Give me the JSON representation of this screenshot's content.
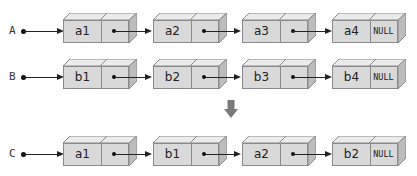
{
  "diagram": {
    "colors": {
      "node_fill": "#d9d9d9",
      "node_top": "#ebebeb",
      "node_side": "#bdbdbd",
      "border": "#8a8a8a",
      "arrow": "#222222",
      "merge_arrow": "#7a7a7a"
    },
    "lists": [
      {
        "pointer": "A",
        "nodes": [
          {
            "data": "a1",
            "next": ""
          },
          {
            "data": "a2",
            "next": ""
          },
          {
            "data": "a3",
            "next": ""
          },
          {
            "data": "a4",
            "next": "NULL"
          }
        ]
      },
      {
        "pointer": "B",
        "nodes": [
          {
            "data": "b1",
            "next": ""
          },
          {
            "data": "b2",
            "next": ""
          },
          {
            "data": "b3",
            "next": ""
          },
          {
            "data": "b4",
            "next": "NULL"
          }
        ]
      },
      {
        "pointer": "C",
        "nodes": [
          {
            "data": "a1",
            "next": ""
          },
          {
            "data": "b1",
            "next": ""
          },
          {
            "data": "a2",
            "next": ""
          },
          {
            "data": "b2",
            "next": "NULL"
          }
        ]
      }
    ],
    "merge_arrow_icon": "down-arrow-icon"
  }
}
